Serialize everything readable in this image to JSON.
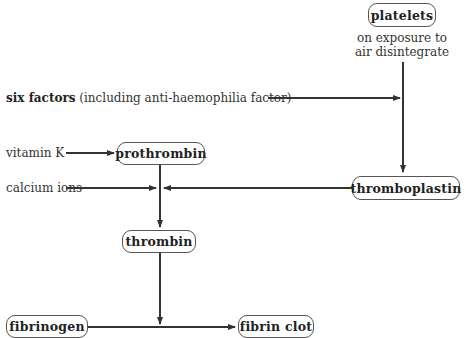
{
  "diagram": {
    "nodes": {
      "platelets": "platelets",
      "platelets_note_line1": "on exposure to",
      "platelets_note_line2": "air disintegrate",
      "prothrombin": "prothrombin",
      "thromboplastin": "thromboplastin",
      "thrombin": "thrombin",
      "fibrinogen": "fibrinogen",
      "fibrin_clot": "fibrin clot"
    },
    "inputs": {
      "six_factors_bold": "six factors",
      "six_factors_rest": " (including anti-haemophilia factor)",
      "vitamin_k": "vitamin K",
      "calcium_ions": "calcium ions"
    },
    "edges": [
      {
        "from": "platelets",
        "to": "thromboplastin"
      },
      {
        "from": "six factors",
        "to": "platelets→thromboplastin line"
      },
      {
        "from": "vitamin K",
        "to": "prothrombin"
      },
      {
        "from": "prothrombin",
        "to": "thrombin"
      },
      {
        "from": "calcium ions",
        "to": "prothrombin→thrombin line"
      },
      {
        "from": "thromboplastin",
        "to": "prothrombin→thrombin line"
      },
      {
        "from": "thrombin",
        "to": "fibrinogen→fibrin clot line"
      },
      {
        "from": "fibrinogen",
        "to": "fibrin clot"
      }
    ],
    "colors": {
      "line": "#333333",
      "border": "#555555",
      "background": "#ffffff"
    }
  }
}
